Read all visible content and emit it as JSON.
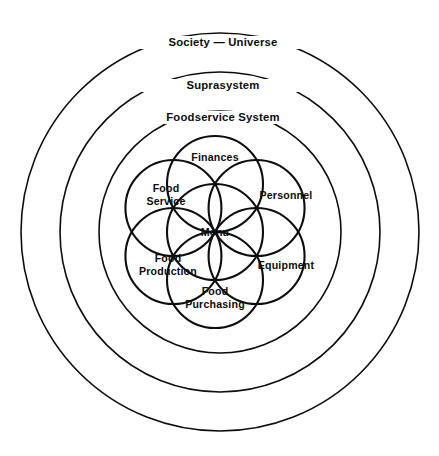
{
  "diagram": {
    "type": "concentric-systems-model",
    "rings": [
      {
        "id": "society",
        "label": "Society  —  Universe",
        "radius": 199,
        "cx": 220,
        "cy": 232
      },
      {
        "id": "suprasystem",
        "label": "Suprasystem",
        "radius": 160,
        "cx": 220,
        "cy": 232
      },
      {
        "id": "foodservice",
        "label": "Foodservice System",
        "radius": 121,
        "cx": 220,
        "cy": 232
      }
    ],
    "core": {
      "center_label": "Menu",
      "circle_radius": 48,
      "center_x": 215,
      "center_y": 232,
      "petals": [
        {
          "id": "finances",
          "label": "Finances",
          "angle_deg": 270
        },
        {
          "id": "personnel",
          "label": "Personnel",
          "angle_deg": 330
        },
        {
          "id": "equipment",
          "label": "Equipment",
          "angle_deg": 30
        },
        {
          "id": "food-purchasing",
          "label": "Food\nPurchasing",
          "angle_deg": 90
        },
        {
          "id": "food-production",
          "label": "Food\nProduction",
          "angle_deg": 150
        },
        {
          "id": "food-service",
          "label": "Food\nService",
          "angle_deg": 210
        }
      ]
    },
    "colors": {
      "stroke": "#0d0d0d",
      "background": "#ffffff",
      "text": "#0d0d0d"
    }
  }
}
